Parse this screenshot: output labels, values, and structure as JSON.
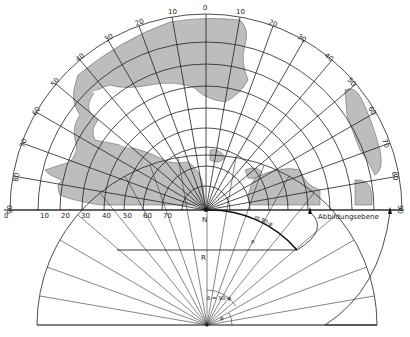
{
  "figure": {
    "pole_label": "N",
    "plane_label": "Abbildungsebene",
    "radius_label": "R",
    "arc_label": "m 90-φ",
    "rho_label": "ρ",
    "angle_label_upper": "δ = 90-φ",
    "angle_label_lower": "φ",
    "meridian_labels_top": [
      "0",
      "10",
      "20",
      "30",
      "40",
      "50",
      "60",
      "70",
      "80",
      "90"
    ],
    "meridian_labels_left": [
      "10",
      "20",
      "30",
      "40",
      "50",
      "60",
      "70",
      "80",
      "90"
    ],
    "meridian_labels_right": [
      "10",
      "20",
      "30",
      "40",
      "50",
      "60",
      "70",
      "80",
      "90"
    ],
    "radius_axis_labels": [
      "0",
      "10",
      "20",
      "30",
      "40",
      "50",
      "60",
      "70"
    ],
    "colors": {
      "land": "#bdbdbd",
      "lines": "#222222",
      "background": "#ffffff"
    }
  }
}
